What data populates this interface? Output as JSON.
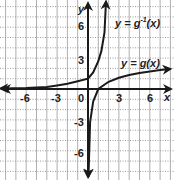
{
  "chart_data": {
    "type": "line",
    "title": "",
    "xlabel": "x",
    "ylabel": "y",
    "xlim": [
      -8.5,
      8.3
    ],
    "ylim": [
      -8.8,
      8.7
    ],
    "grid": true,
    "grid_style": "dotted horizontal, solid vertical",
    "x_ticks": [
      -6,
      -3,
      0,
      3,
      6
    ],
    "y_ticks": [
      -6,
      -3,
      3,
      6
    ],
    "x_tick_labels": [
      "-6",
      "-3",
      "0",
      "3",
      "6"
    ],
    "y_tick_labels": [
      "-6",
      "-3",
      "3",
      "6"
    ],
    "series": [
      {
        "name": "y = g(x)",
        "function": "g(x) = ln-like logarithmic curve, vertical asymptote near x = 0, passes approx (1,0), increases slowly to about 1.7 at x = 8",
        "x": [
          0.05,
          0.2,
          0.5,
          1,
          2,
          3,
          4,
          5,
          6,
          7,
          8
        ],
        "y": [
          -8.5,
          -3.2,
          -1.2,
          0,
          0.7,
          1.1,
          1.35,
          1.55,
          1.7,
          1.85,
          1.95
        ],
        "arrows": "both ends"
      },
      {
        "name": "y = g^-1(x)",
        "function": "exponential-like inverse, horizontal asymptote y = 0 on left, passes approx (0,1), rises steeply to top near x = 1.7",
        "x": [
          -8.5,
          -6,
          -4,
          -3,
          -2,
          -1,
          0,
          0.5,
          1,
          1.3,
          1.6,
          1.75
        ],
        "y": [
          0.05,
          0.1,
          0.2,
          0.35,
          0.5,
          0.75,
          1,
          1.6,
          2.7,
          3.7,
          5.5,
          8.5
        ],
        "arrows": "both ends"
      }
    ],
    "annotations": [
      {
        "text": "y = g⁻¹(x)",
        "near": [
          4.5,
          6.3
        ]
      },
      {
        "text": "y = g(x)",
        "near": [
          5,
          2.6
        ]
      }
    ],
    "legend": "none (inline labels)"
  },
  "labels": {
    "x_axis": "x",
    "y_axis": "y",
    "ginv_prefix": "y = g",
    "ginv_sup": "-1",
    "ginv_suffix": "(x)",
    "g_label": "y = g(x)",
    "tick_x_m6": "-6",
    "tick_x_m3": "-3",
    "tick_x_0": "0",
    "tick_x_3": "3",
    "tick_x_6": "6",
    "tick_y_6": "6",
    "tick_y_3": "3",
    "tick_y_m3": "-3",
    "tick_y_m6": "-6"
  },
  "colors": {
    "curve": "#1a1a1a",
    "axis": "#1a1a1a",
    "grid": "#9a9a9a",
    "background": "#ffffff"
  }
}
